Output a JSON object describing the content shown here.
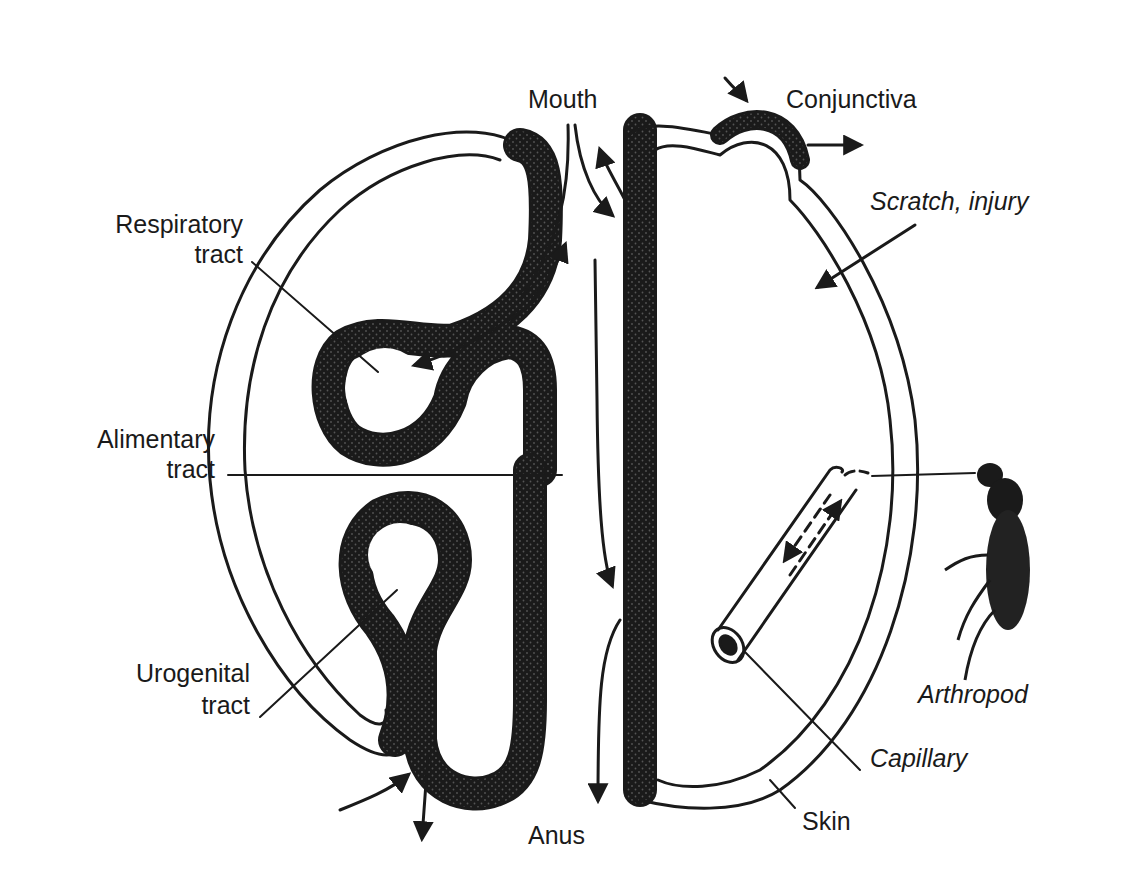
{
  "figure": {
    "colors": {
      "ink": "#1a1a1a",
      "background": "#ffffff",
      "stipple": "#555555"
    }
  },
  "labels": {
    "mouth": "Mouth",
    "conjunctiva": "Conjunctiva",
    "scratch_injury": "Scratch, injury",
    "respiratory_1": "Respiratory",
    "respiratory_2": "tract",
    "alimentary_1": "Alimentary",
    "alimentary_2": "tract",
    "urogenital_1": "Urogenital",
    "urogenital_2": "tract",
    "arthropod": "Arthropod",
    "capillary": "Capillary",
    "skin": "Skin",
    "anus": "Anus"
  }
}
